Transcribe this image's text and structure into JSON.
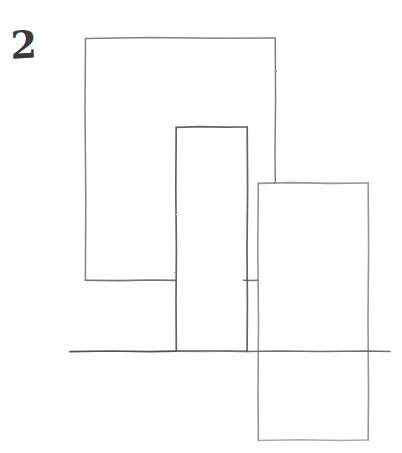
{
  "figure": {
    "label": "2",
    "label_name": "page-number-2",
    "medium": "pencil line drawing on white paper",
    "background_color": "#ffffff",
    "stroke_color": "#6b6b6b",
    "stroke_color_dark": "#4a4a4a",
    "stroke_color_light": "#8d8d8d",
    "canvas": {
      "width": 402,
      "height": 453
    },
    "shapes": [
      {
        "name": "large-left-rectangle",
        "role": "back-left block",
        "x1": 85,
        "y1": 38,
        "x2": 275,
        "y2": 280,
        "width": 190,
        "height": 242,
        "bottom_edge_occluded_from": 176,
        "bottom_edge_occluded_to": 243,
        "stroke": "#777777"
      },
      {
        "name": "middle-tall-rectangle",
        "role": "center column block",
        "x1": 176,
        "y1": 127,
        "x2": 247,
        "y2": 351,
        "width": 71,
        "height": 224,
        "stroke": "#5a5a5a"
      },
      {
        "name": "right-rectangle",
        "role": "front-right block crossing the ground line",
        "x1": 258,
        "y1": 183,
        "x2": 368,
        "y2": 440,
        "width": 110,
        "height": 257,
        "stroke": "#8a8a8a"
      }
    ],
    "ground_line": {
      "name": "horizontal-ground-line",
      "x1": 70,
      "y1": 351,
      "x2": 390,
      "y2": 352,
      "length": 320,
      "stroke": "#5f5f5f"
    }
  }
}
